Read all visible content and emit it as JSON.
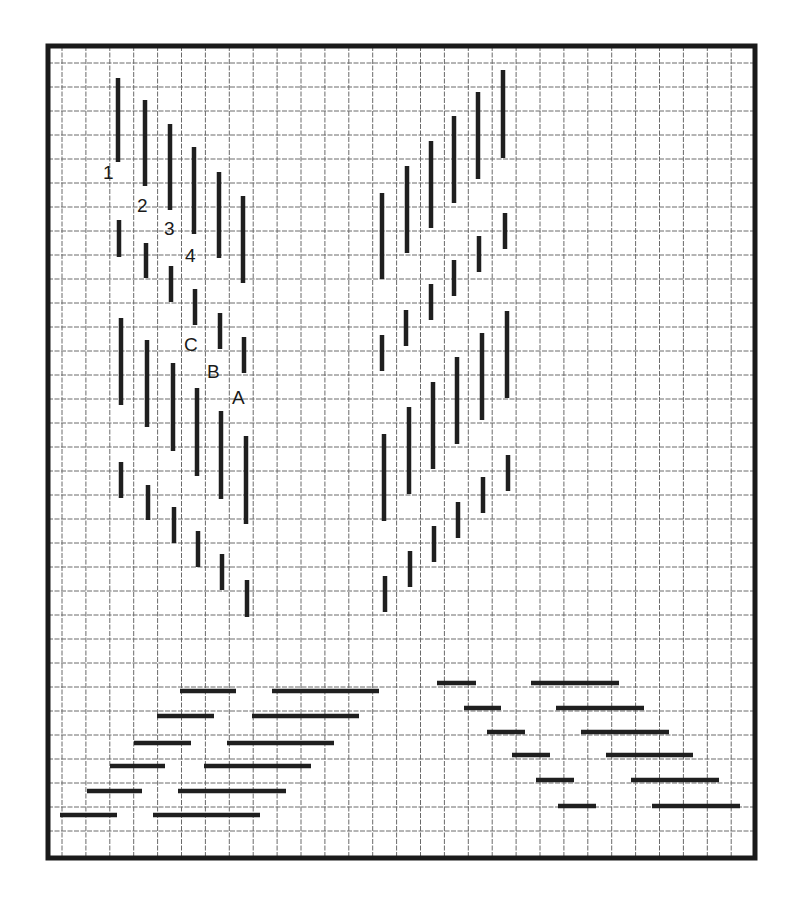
{
  "diagram": {
    "title": "",
    "colors": {
      "background": "#ffffff",
      "grid": "#6a6a6a",
      "stroke": "#1f1f1f",
      "border": "#1a1a1a"
    },
    "frame": {
      "x": 48,
      "y": 46,
      "width": 707,
      "height": 812
    },
    "grid": {
      "x0": 62,
      "y0": 63,
      "dx": 23.9,
      "dy": 24.0,
      "x_max": 752,
      "y_max": 855
    },
    "labels": [
      {
        "text": "1",
        "x": 103,
        "y": 179
      },
      {
        "text": "2",
        "x": 137,
        "y": 212
      },
      {
        "text": "3",
        "x": 164,
        "y": 235
      },
      {
        "text": "4",
        "x": 185,
        "y": 262
      },
      {
        "text": "C",
        "x": 184,
        "y": 351
      },
      {
        "text": "B",
        "x": 207,
        "y": 378
      },
      {
        "text": "A",
        "x": 232,
        "y": 404
      }
    ],
    "vertical_segments": [
      [
        118,
        78,
        162
      ],
      [
        145,
        100,
        186
      ],
      [
        170,
        124,
        210
      ],
      [
        194,
        147,
        234
      ],
      [
        219,
        172,
        258
      ],
      [
        243,
        196,
        283
      ],
      [
        119,
        220,
        257
      ],
      [
        146,
        243,
        278
      ],
      [
        171,
        266,
        302
      ],
      [
        195,
        289,
        325
      ],
      [
        220,
        313,
        349
      ],
      [
        244,
        337,
        373
      ],
      [
        121,
        318,
        405
      ],
      [
        147,
        340,
        427
      ],
      [
        173,
        363,
        451
      ],
      [
        197,
        388,
        476
      ],
      [
        221,
        411,
        499
      ],
      [
        246,
        436,
        524
      ],
      [
        121,
        462,
        498
      ],
      [
        148,
        485,
        520
      ],
      [
        174,
        507,
        543
      ],
      [
        198,
        531,
        567
      ],
      [
        222,
        554,
        590
      ],
      [
        247,
        580,
        617
      ],
      [
        382,
        193,
        279
      ],
      [
        407,
        166,
        253
      ],
      [
        431,
        141,
        228
      ],
      [
        454,
        116,
        203
      ],
      [
        478,
        92,
        179
      ],
      [
        503,
        70,
        158
      ],
      [
        382,
        335,
        371
      ],
      [
        406,
        310,
        346
      ],
      [
        431,
        284,
        320
      ],
      [
        454,
        260,
        296
      ],
      [
        479,
        236,
        272
      ],
      [
        505,
        213,
        249
      ],
      [
        384,
        434,
        521
      ],
      [
        409,
        407,
        494
      ],
      [
        433,
        382,
        469
      ],
      [
        457,
        357,
        444
      ],
      [
        482,
        333,
        420
      ],
      [
        507,
        311,
        398
      ],
      [
        385,
        576,
        612
      ],
      [
        410,
        551,
        587
      ],
      [
        434,
        526,
        562
      ],
      [
        458,
        502,
        538
      ],
      [
        483,
        477,
        513
      ],
      [
        508,
        455,
        491
      ]
    ],
    "horizontal_segments": [
      [
        691,
        180,
        236
      ],
      [
        691,
        272,
        379
      ],
      [
        716,
        157,
        214
      ],
      [
        716,
        252,
        359
      ],
      [
        743,
        134,
        191
      ],
      [
        743,
        227,
        334
      ],
      [
        766,
        110,
        165
      ],
      [
        766,
        204,
        311
      ],
      [
        791,
        87,
        142
      ],
      [
        791,
        178,
        286
      ],
      [
        815,
        60,
        117
      ],
      [
        815,
        153,
        260
      ],
      [
        683,
        437,
        476
      ],
      [
        683,
        531,
        619
      ],
      [
        708,
        464,
        501
      ],
      [
        708,
        556,
        644
      ],
      [
        732,
        487,
        525
      ],
      [
        732,
        581,
        669
      ],
      [
        755,
        512,
        550
      ],
      [
        755,
        606,
        693
      ],
      [
        780,
        536,
        574
      ],
      [
        780,
        631,
        719
      ],
      [
        806,
        558,
        596
      ],
      [
        806,
        652,
        740
      ]
    ]
  }
}
